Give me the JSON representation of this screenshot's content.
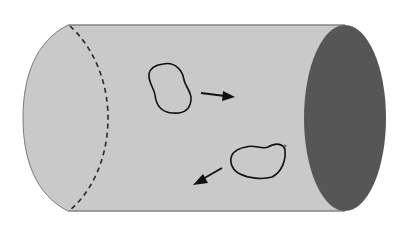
{
  "diagram": {
    "colors": {
      "background": "#ffffff",
      "tube_body": "#c9c9c9",
      "tube_outline": "#7a7a7a",
      "tube_end_opening": "#565656",
      "dashed_section": "#2a2a2a",
      "cell_outline": "#111111",
      "arrow": "#111111"
    },
    "elements": [
      {
        "id": "tube",
        "shape": "cylinder",
        "orientation": "horizontal"
      },
      {
        "id": "dashed-cross-section",
        "shape": "dashed-arc",
        "position": "left"
      },
      {
        "id": "tube-opening",
        "shape": "ellipse",
        "position": "right",
        "fill": "dark"
      },
      {
        "id": "cell-1",
        "shape": "blob",
        "position": "upper-center"
      },
      {
        "id": "arrow-1",
        "direction": "right"
      },
      {
        "id": "cell-2",
        "shape": "blob",
        "position": "lower-right"
      },
      {
        "id": "arrow-2",
        "direction": "down-left"
      }
    ]
  }
}
